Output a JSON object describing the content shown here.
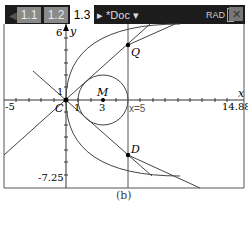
{
  "toolbar": {
    "tabs": [
      {
        "label": "1.1",
        "active": false
      },
      {
        "label": "1.2",
        "active": false
      },
      {
        "label": "1.3",
        "active": true
      }
    ],
    "doc_label": "*Doc",
    "mode": "RAD"
  },
  "graph": {
    "x_axis_label": "x",
    "y_axis_label": "y",
    "x_min": "-5",
    "x_max": "14.88",
    "y_max": "6",
    "y_min": "-7.25",
    "tick_one_x": "1",
    "tick_one_y": "1",
    "points": {
      "Q": "Q",
      "D": "D",
      "M": "M",
      "C": "C"
    },
    "m_value": "3",
    "line_label": "x=5"
  },
  "caption": "(b)"
}
